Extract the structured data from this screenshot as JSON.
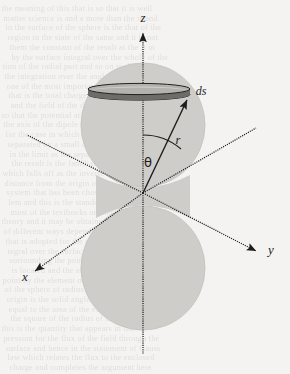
{
  "figure": {
    "caption_present": false,
    "background_color": "#f4f3f1",
    "ink_color": "#1c1c1c"
  },
  "labels": {
    "z_axis": "z",
    "x_axis": "x",
    "y_axis": "y",
    "radius": "r",
    "polar_angle": "θ",
    "surface_element": "ds"
  },
  "geometry": {
    "origin": {
      "x": 143,
      "y": 193
    },
    "lobe_fill": "#cfcdc9",
    "lobe_edge": "#c4c2be",
    "upper_lobe": {
      "cx": 143,
      "cy": 125,
      "r": 62
    },
    "lower_lobe": {
      "cx": 143,
      "cy": 268,
      "r": 62
    },
    "ring_band": {
      "cx": 139,
      "cy": 93,
      "rx": 51,
      "ry": 6,
      "thickness": 7,
      "top_fill": "#b9b7b3",
      "side_fill": "#6e6c69",
      "edge": "#2b2a28"
    },
    "z_axis_style": "dotted",
    "other_axes_style": "dotted",
    "theta_arc": {
      "radius": 58,
      "from_deg": 90,
      "to_deg": 48
    },
    "r_vector_tip": {
      "x": 188,
      "y": 99
    }
  },
  "label_positions": {
    "z": {
      "x": 143,
      "y": 22
    },
    "x": {
      "x": 25,
      "y": 281
    },
    "y": {
      "x": 271,
      "y": 254
    },
    "r": {
      "x": 178,
      "y": 144
    },
    "theta": {
      "x": 148,
      "y": 167
    },
    "ds": {
      "x": 201,
      "y": 95
    }
  },
  "background_bleed_text": [
    "the meaning of this that is so that it is well",
    "matter science is and a more than the is and",
    "in the surface of the sphere is the that of the",
    "region in the state of the same and it is not",
    "them the constant of the result at the it in",
    "by the surface integral over the whole of the",
    "tion of the radial part and so on to the out",
    "the integration over the angle of the sphere",
    "one of the most important of the results of",
    "that is the total charge enclosed in the vol",
    "and the field of the dipole at the point on",
    "so that the potential at a distance r from",
    "the axis of the dipole is given by the form",
    "for the case in which the two charges are",
    "separated by a small distance along the z",
    "in the limit as the separation tends to zero",
    "the result is the familiar dipole potential",
    "which falls off as the inverse square of the",
    "distance from the origin of the coordinate",
    "system that has been chosen for the prob",
    "lem and this is the standard result given in",
    "most of the textbooks on electromagnetic",
    "theory and it may be obtained in a number",
    "of different ways depending on the method",
    "that is adopted for the evaluation of the in",
    "tegral over the surface of the small sphere",
    "surrounding the point at which the charge",
    "is located and the angle subtended at that",
    "point by the element of area on the surface",
    "of the sphere of radius r centred upon the",
    "origin is the solid angle element which is",
    "equal to the area of the element divided by",
    "the square of the radius of the sphere and",
    "this is the quantity that appears in the ex",
    "pression for the flux of the field through the",
    "surface and hence in the statement of Gauss",
    "law which relates the flux to the enclosed",
    "charge and completes the argument here"
  ]
}
